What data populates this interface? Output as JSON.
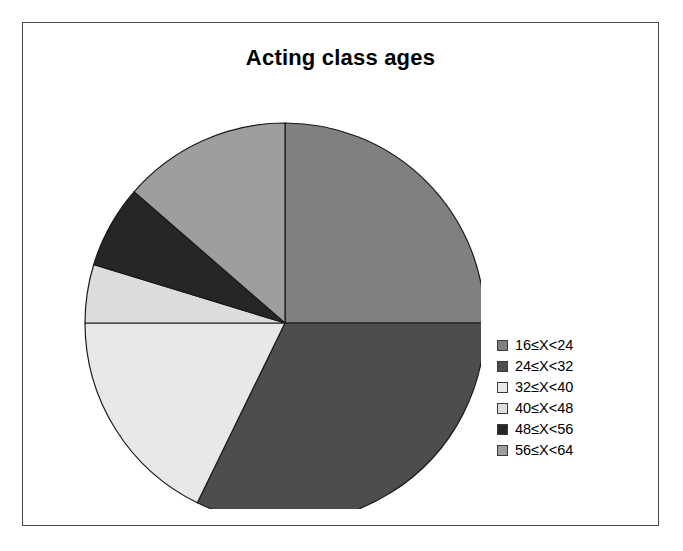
{
  "chart": {
    "title": "Acting class ages",
    "frame_border_color": "#4a4a4a",
    "background_color": "#ffffff"
  },
  "legend": {
    "position": "right",
    "entries": [
      {
        "label": "16≤X<24",
        "color": "#808080",
        "swatch_name": "legend-swatch-16-24"
      },
      {
        "label": "24≤X<32",
        "color": "#4d4d4d",
        "swatch_name": "legend-swatch-24-32"
      },
      {
        "label": "32≤X<40",
        "color": "#e8e8e8",
        "swatch_name": "legend-swatch-32-40"
      },
      {
        "label": "40≤X<48",
        "color": "#dcdcdc",
        "swatch_name": "legend-swatch-40-48"
      },
      {
        "label": "48≤X<56",
        "color": "#262626",
        "swatch_name": "legend-swatch-48-56"
      },
      {
        "label": "56≤X<64",
        "color": "#9e9e9e",
        "swatch_name": "legend-swatch-56-64"
      }
    ]
  },
  "chart_data": {
    "type": "pie",
    "title": "Acting class ages",
    "xlabel": "",
    "ylabel": "",
    "legend_position": "right",
    "grid": false,
    "start_angle_deg": 0,
    "direction": "clockwise",
    "categories": [
      "16≤X<24",
      "24≤X<32",
      "32≤X<40",
      "40≤X<48",
      "48≤X<56",
      "56≤X<64"
    ],
    "values": [
      25,
      32,
      18,
      5,
      7,
      14
    ],
    "value_unit": "percent",
    "angles_deg": [
      90,
      116,
      64,
      17,
      24,
      49
    ],
    "colors": [
      "#808080",
      "#4d4d4d",
      "#e8e8e8",
      "#dcdcdc",
      "#262626",
      "#9e9e9e"
    ],
    "slice_border_color": "#1a1a1a",
    "center": {
      "x": 244,
      "y": 244
    },
    "radius": 200
  }
}
